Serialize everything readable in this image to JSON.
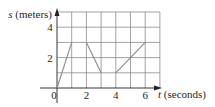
{
  "chart_data": {
    "type": "line",
    "title": "",
    "xlabel": "t (seconds)",
    "ylabel": "s (meters)",
    "xlabel_var": "t",
    "xlabel_unit": "(seconds)",
    "ylabel_var": "s",
    "ylabel_unit": "(meters)",
    "xlim": [
      0,
      7
    ],
    "ylim": [
      0,
      5
    ],
    "x_ticks": [
      "0",
      "2",
      "4",
      "6"
    ],
    "y_ticks": [
      "2",
      "4"
    ],
    "grid": true,
    "grid_step_x": 1,
    "grid_step_y": 1,
    "series": [
      {
        "name": "segment-1",
        "x": [
          0,
          1
        ],
        "y": [
          0,
          3
        ]
      },
      {
        "name": "segment-2",
        "x": [
          2,
          3
        ],
        "y": [
          3,
          1
        ]
      },
      {
        "name": "segment-3",
        "x": [
          4,
          6
        ],
        "y": [
          1,
          3
        ]
      }
    ],
    "colors": {
      "grid": "#8a8a8a",
      "line": "#8a8a8a",
      "axis": "#231f20"
    }
  }
}
